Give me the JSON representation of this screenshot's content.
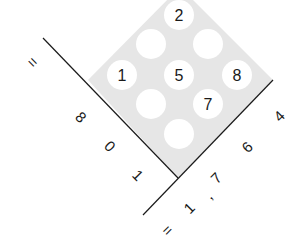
{
  "diagram": {
    "type": "lattice-multiplication",
    "colors": {
      "lattice_fill": "#e6e6e6",
      "circle_fill": "#ffffff",
      "line": "#1a1a1a",
      "text": "#1a1a1a"
    },
    "cells": {
      "top": "2",
      "upper_left": "",
      "upper_right": "",
      "mid_left": "1",
      "center": "5",
      "mid_right": "8",
      "lower_left": "",
      "lower_right": "7",
      "bottom": ""
    },
    "left_factor": {
      "equals": "=",
      "digits": [
        "8",
        "0",
        "1"
      ]
    },
    "right_factor": {
      "equals": "=",
      "digits": [
        "1",
        ",",
        "7",
        "6",
        "4"
      ]
    }
  }
}
